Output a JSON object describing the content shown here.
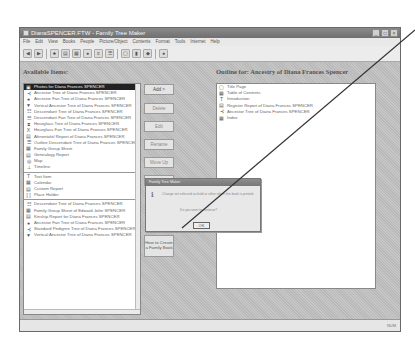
{
  "window": {
    "title": "DianaSPENCER.FTW - Family Tree Maker",
    "controls": [
      "minimize",
      "maximize",
      "close"
    ]
  },
  "menu": [
    "File",
    "Edit",
    "View",
    "Books",
    "People",
    "Picture/Object",
    "Contents",
    "Format",
    "Tools",
    "Internet",
    "Help"
  ],
  "toolbar": {
    "buttons": [
      "back",
      "forward",
      "tree",
      "family-page",
      "pedigree",
      "descendant",
      "outline",
      "index",
      "records",
      "books",
      "reports",
      "help"
    ]
  },
  "available_items": {
    "header": "Available Items:",
    "items": [
      {
        "icon": "photo",
        "label": "Photos for Diana Frances SPENCER",
        "selected": true
      },
      {
        "icon": "ancestor-tree",
        "label": "Ancestor Tree of Diana Frances SPENCER"
      },
      {
        "icon": "fan-tree",
        "label": "Ancestor Fan Tree of Diana Frances SPENCER"
      },
      {
        "icon": "vertical-tree",
        "label": "Vertical Ancestor Tree of Diana Frances SPENCER"
      },
      {
        "icon": "descendant-tree",
        "label": "Descendant Tree of Diana Frances SPENCER"
      },
      {
        "icon": "descendant-fan",
        "label": "Descendant Fan Tree of Diana Frances SPENCER"
      },
      {
        "icon": "hourglass",
        "label": "Hourglass Tree of Diana Frances SPENCER"
      },
      {
        "icon": "hourglass-fan",
        "label": "Hourglass Fan Tree of Diana Frances SPENCER"
      },
      {
        "icon": "report",
        "label": "Ahnentafel Report of Diana Frances SPENCER"
      },
      {
        "icon": "outline",
        "label": "Outline Descendant Tree of Diana Frances SPENCER"
      },
      {
        "icon": "group-sheet",
        "label": "Family Group Sheet"
      },
      {
        "icon": "genealogy",
        "label": "Genealogy Report"
      },
      {
        "icon": "map",
        "label": "Map"
      },
      {
        "icon": "timeline",
        "label": "Timeline"
      }
    ],
    "items_group2": [
      {
        "icon": "text",
        "label": "Text Item"
      },
      {
        "icon": "calendar",
        "label": "Calendar"
      },
      {
        "icon": "custom-report",
        "label": "Custom Report"
      },
      {
        "icon": "placeholder",
        "label": "Place Holder"
      }
    ],
    "items_group3": [
      {
        "icon": "descendant-tree",
        "label": "Descendant Tree of Diana Frances SPENCER"
      },
      {
        "icon": "group-sheet",
        "label": "Family Group Sheet of Edward John SPENCER"
      },
      {
        "icon": "report",
        "label": "Kinship Report for Diana Frances SPENCER"
      },
      {
        "icon": "fan-tree",
        "label": "Ancestor Fan Tree of Diana Frances SPENCER"
      },
      {
        "icon": "ancestor-tree",
        "label": "Standard Pedigree Tree of Diana Frances SPENCER"
      },
      {
        "icon": "vertical-tree",
        "label": "Vertical Ancestor Tree of Diana Frances SPENCER"
      }
    ]
  },
  "middle_buttons": [
    {
      "label": "Add >",
      "enabled": true
    },
    {
      "label": "Delete",
      "enabled": false
    },
    {
      "label": "Edit",
      "enabled": false
    },
    {
      "label": "Rename",
      "enabled": false
    },
    {
      "label": "Move Up",
      "enabled": false
    },
    {
      "label": "Move Down",
      "enabled": false
    }
  ],
  "howto_button": "How to Create a Family Book",
  "outline": {
    "header": "Outline for: Ancestry of Diana Frances Spencer",
    "items": [
      {
        "icon": "page",
        "label": "Title Page"
      },
      {
        "icon": "toc",
        "label": "Table of Contents"
      },
      {
        "icon": "text",
        "label": "Introduction"
      },
      {
        "icon": "report",
        "label": "Register Report of Diana Frances SPENCER"
      },
      {
        "icon": "ancestor-tree",
        "label": "Ancestor Tree of Diana Frances SPENCER"
      },
      {
        "icon": "index",
        "label": "Index"
      }
    ]
  },
  "dialog": {
    "title": "Family Tree Maker",
    "message": "Change set selected as bold or other when this book is printed.",
    "message2": "Do you want to continue?",
    "ok_label": "OK"
  },
  "status": {
    "right": "NUM"
  },
  "annotation": {
    "color": "#333333",
    "from": [
      415,
      30
    ],
    "to": [
      182,
      228
    ]
  }
}
